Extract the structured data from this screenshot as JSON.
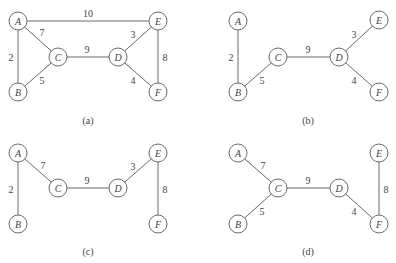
{
  "node_radius": 9,
  "graphs": [
    {
      "id": "a",
      "caption": "(a)",
      "caption_pos": [
        88,
        120
      ],
      "nodes": [
        {
          "id": "A",
          "label": "A",
          "x": 18,
          "y": 21
        },
        {
          "id": "B",
          "label": "B",
          "x": 18,
          "y": 92
        },
        {
          "id": "C",
          "label": "C",
          "x": 58,
          "y": 57
        },
        {
          "id": "D",
          "label": "D",
          "x": 118,
          "y": 57
        },
        {
          "id": "E",
          "label": "E",
          "x": 158,
          "y": 21
        },
        {
          "id": "F",
          "label": "F",
          "x": 158,
          "y": 92
        }
      ],
      "edges": [
        {
          "from": "A",
          "to": "E",
          "weight": "10",
          "lx": 88,
          "ly": 13
        },
        {
          "from": "A",
          "to": "B",
          "weight": "2",
          "lx": 11,
          "ly": 57
        },
        {
          "from": "A",
          "to": "C",
          "weight": "7",
          "lx": 42,
          "ly": 32
        },
        {
          "from": "B",
          "to": "C",
          "weight": "5",
          "lx": 42,
          "ly": 80
        },
        {
          "from": "C",
          "to": "D",
          "weight": "9",
          "lx": 87,
          "ly": 49
        },
        {
          "from": "D",
          "to": "E",
          "weight": "3",
          "lx": 133,
          "ly": 34
        },
        {
          "from": "D",
          "to": "F",
          "weight": "4",
          "lx": 133,
          "ly": 80
        },
        {
          "from": "E",
          "to": "F",
          "weight": "8",
          "lx": 165,
          "ly": 57
        }
      ]
    },
    {
      "id": "b",
      "caption": "(b)",
      "caption_pos": [
        308,
        120
      ],
      "nodes": [
        {
          "id": "A",
          "label": "A",
          "x": 238,
          "y": 21
        },
        {
          "id": "B",
          "label": "B",
          "x": 238,
          "y": 92
        },
        {
          "id": "C",
          "label": "C",
          "x": 278,
          "y": 57
        },
        {
          "id": "D",
          "label": "D",
          "x": 339,
          "y": 57
        },
        {
          "id": "E",
          "label": "E",
          "x": 379,
          "y": 20
        },
        {
          "id": "F",
          "label": "F",
          "x": 379,
          "y": 92
        }
      ],
      "edges": [
        {
          "from": "A",
          "to": "B",
          "weight": "2",
          "lx": 231,
          "ly": 57
        },
        {
          "from": "B",
          "to": "C",
          "weight": "5",
          "lx": 262,
          "ly": 80
        },
        {
          "from": "C",
          "to": "D",
          "weight": "9",
          "lx": 308,
          "ly": 49
        },
        {
          "from": "D",
          "to": "E",
          "weight": "3",
          "lx": 354,
          "ly": 34
        },
        {
          "from": "D",
          "to": "F",
          "weight": "4",
          "lx": 354,
          "ly": 80
        }
      ]
    },
    {
      "id": "c",
      "caption": "(c)",
      "caption_pos": [
        88,
        251
      ],
      "nodes": [
        {
          "id": "A",
          "label": "A",
          "x": 18,
          "y": 153
        },
        {
          "id": "B",
          "label": "B",
          "x": 18,
          "y": 224
        },
        {
          "id": "C",
          "label": "C",
          "x": 58,
          "y": 188
        },
        {
          "id": "D",
          "label": "D",
          "x": 118,
          "y": 188
        },
        {
          "id": "E",
          "label": "E",
          "x": 158,
          "y": 153
        },
        {
          "id": "F",
          "label": "F",
          "x": 158,
          "y": 224
        }
      ],
      "edges": [
        {
          "from": "A",
          "to": "B",
          "weight": "2",
          "lx": 11,
          "ly": 189
        },
        {
          "from": "A",
          "to": "C",
          "weight": "7",
          "lx": 43,
          "ly": 165
        },
        {
          "from": "C",
          "to": "D",
          "weight": "9",
          "lx": 87,
          "ly": 180
        },
        {
          "from": "D",
          "to": "E",
          "weight": "3",
          "lx": 133,
          "ly": 166
        },
        {
          "from": "E",
          "to": "F",
          "weight": "8",
          "lx": 165,
          "ly": 189
        }
      ]
    },
    {
      "id": "d",
      "caption": "(d)",
      "caption_pos": [
        308,
        251
      ],
      "nodes": [
        {
          "id": "A",
          "label": "A",
          "x": 238,
          "y": 153
        },
        {
          "id": "B",
          "label": "B",
          "x": 238,
          "y": 224
        },
        {
          "id": "C",
          "label": "C",
          "x": 278,
          "y": 188
        },
        {
          "id": "D",
          "label": "D",
          "x": 339,
          "y": 188
        },
        {
          "id": "E",
          "label": "E",
          "x": 379,
          "y": 153
        },
        {
          "id": "F",
          "label": "F",
          "x": 379,
          "y": 224
        }
      ],
      "edges": [
        {
          "from": "A",
          "to": "C",
          "weight": "7",
          "lx": 263,
          "ly": 165
        },
        {
          "from": "B",
          "to": "C",
          "weight": "5",
          "lx": 262,
          "ly": 211
        },
        {
          "from": "C",
          "to": "D",
          "weight": "9",
          "lx": 308,
          "ly": 180
        },
        {
          "from": "D",
          "to": "F",
          "weight": "4",
          "lx": 354,
          "ly": 211
        },
        {
          "from": "E",
          "to": "F",
          "weight": "8",
          "lx": 386,
          "ly": 189
        }
      ]
    }
  ]
}
